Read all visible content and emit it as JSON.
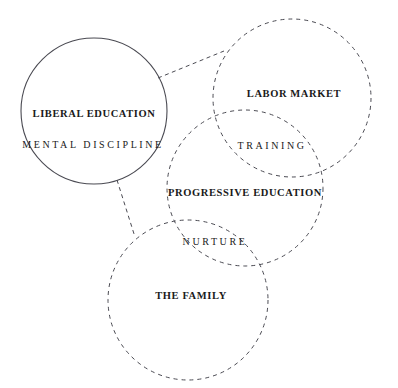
{
  "diagram": {
    "background_color": "#ffffff",
    "stroke_color": "#4a4a52",
    "text_color": "#1a1a1a",
    "circles": [
      {
        "id": "liberal-education",
        "label": "LIBERAL EDUCATION",
        "sub_label": "MENTAL DISCIPLINE",
        "stroke_style": "solid",
        "cx": 94,
        "cy": 111,
        "r": 73
      },
      {
        "id": "labor-market",
        "label": "LABOR MARKET",
        "sub_label": "TRAINING",
        "stroke_style": "dashed",
        "cx": 292,
        "cy": 98,
        "r": 79
      },
      {
        "id": "progressive-education",
        "label": "PROGRESSIVE EDUCATION",
        "sub_label": "NURTURE",
        "stroke_style": "dashed",
        "cx": 245,
        "cy": 188,
        "r": 78
      },
      {
        "id": "the-family",
        "label": "THE FAMILY",
        "sub_label": "",
        "stroke_style": "dashed",
        "cx": 188,
        "cy": 300,
        "r": 80
      }
    ],
    "labels": [
      {
        "id": "liberal-education-label",
        "text": "LIBERAL EDUCATION",
        "x": 94,
        "y": 113,
        "style": "primary"
      },
      {
        "id": "mental-discipline-label",
        "text": "MENTAL DISCIPLINE",
        "x": 93,
        "y": 144,
        "style": "secondary"
      },
      {
        "id": "labor-market-label",
        "text": "LABOR MARKET",
        "x": 294,
        "y": 93,
        "style": "primary"
      },
      {
        "id": "training-label",
        "text": "TRAINING",
        "x": 272,
        "y": 145,
        "style": "secondary"
      },
      {
        "id": "progressive-education-label",
        "text": "PROGRESSIVE EDUCATION",
        "x": 245,
        "y": 192,
        "style": "primary"
      },
      {
        "id": "nurture-label",
        "text": "NURTURE",
        "x": 215,
        "y": 241,
        "style": "secondary"
      },
      {
        "id": "the-family-label",
        "text": "THE FAMILY",
        "x": 191,
        "y": 295,
        "style": "primary"
      }
    ],
    "connectors": [
      {
        "id": "liberal-to-labor-connector",
        "x1": 158,
        "y1": 78,
        "x2": 224,
        "y2": 51
      },
      {
        "id": "liberal-to-family-connector",
        "x1": 117,
        "y1": 180,
        "x2": 135,
        "y2": 237
      }
    ]
  }
}
